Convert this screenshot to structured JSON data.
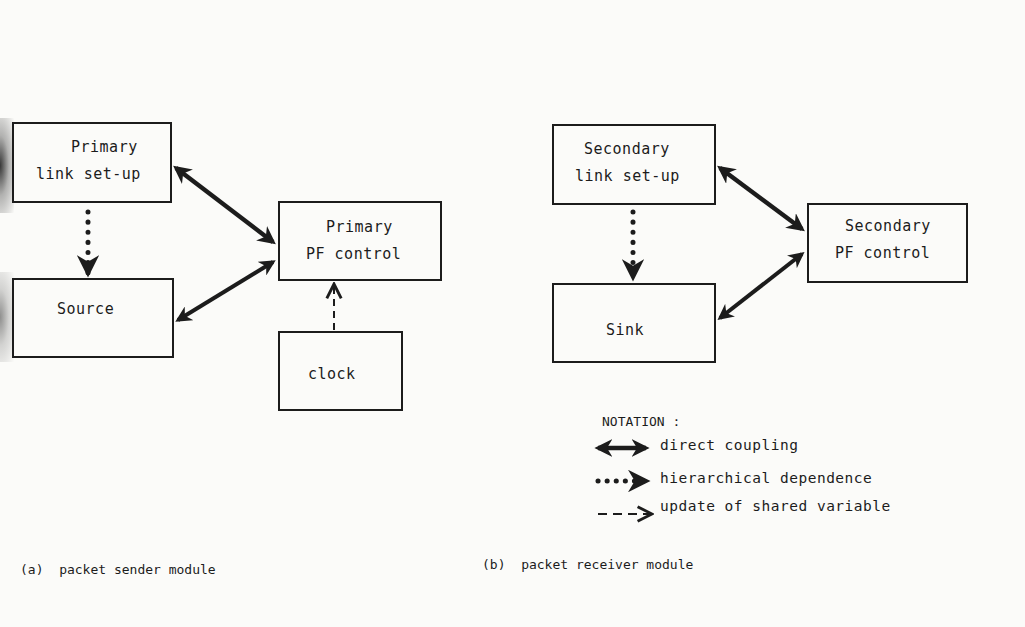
{
  "figure": {
    "panel_a": {
      "caption": "(a)  packet sender module",
      "boxes": {
        "link_setup": {
          "lines": [
            "Primary",
            "link set-up"
          ]
        },
        "source": {
          "lines": [
            "Source"
          ]
        },
        "pf_control": {
          "lines": [
            "Primary",
            "PF control"
          ]
        },
        "clock": {
          "lines": [
            "clock"
          ]
        }
      },
      "edges": [
        {
          "from": "link_setup",
          "to": "pf_control",
          "type": "direct coupling"
        },
        {
          "from": "source",
          "to": "pf_control",
          "type": "direct coupling"
        },
        {
          "from": "link_setup",
          "to": "source",
          "type": "hierarchical dependence"
        },
        {
          "from": "clock",
          "to": "pf_control",
          "type": "update of shared variable"
        }
      ]
    },
    "panel_b": {
      "caption": "(b)  packet receiver module",
      "boxes": {
        "link_setup": {
          "lines": [
            "Secondary",
            "link set-up"
          ]
        },
        "sink": {
          "lines": [
            "Sink"
          ]
        },
        "pf_control": {
          "lines": [
            "Secondary",
            "PF control"
          ]
        }
      },
      "edges": [
        {
          "from": "link_setup",
          "to": "pf_control",
          "type": "direct coupling"
        },
        {
          "from": "sink",
          "to": "pf_control",
          "type": "direct coupling"
        },
        {
          "from": "link_setup",
          "to": "sink",
          "type": "hierarchical dependence"
        }
      ]
    },
    "notation": {
      "title": "NOTATION :",
      "items": [
        {
          "symbol": "double-headed-thick-arrow",
          "label": "direct coupling"
        },
        {
          "symbol": "dotted-arrow",
          "label": "hierarchical dependence"
        },
        {
          "symbol": "dashed-arrow",
          "label": "update of shared variable"
        }
      ]
    }
  }
}
